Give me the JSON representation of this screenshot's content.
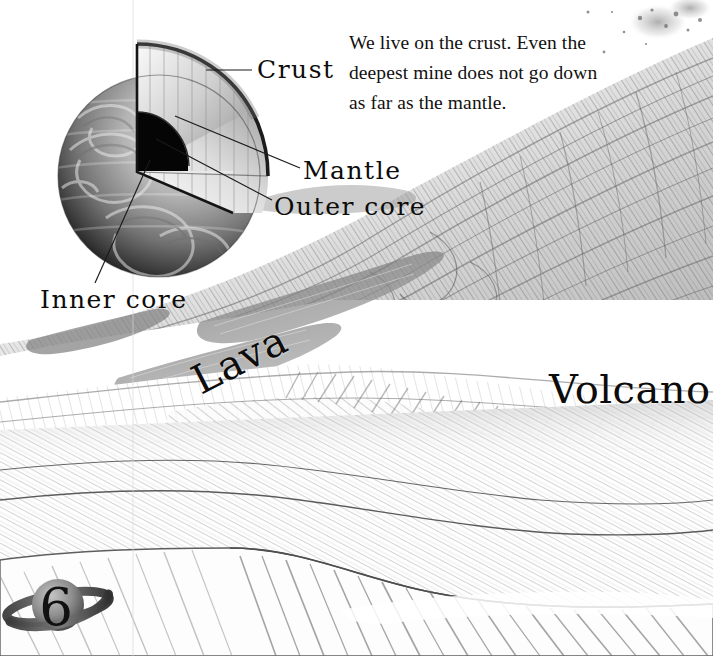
{
  "page": {
    "number": "6",
    "background_color": "#ffffff",
    "ink_color": "#12110f"
  },
  "body_text": {
    "line1": "We live on the crust. Even the",
    "line2": "deepest mine does not go down",
    "line3": "as far as the mantle.",
    "full": "We live on the crust. Even the deepest mine does not go down as far as the mantle."
  },
  "earth_diagram": {
    "title": "Earth cutaway",
    "labels": {
      "crust": "Crust",
      "mantle": "Mantle",
      "outer_core": "Outer core",
      "inner_core": "Inner core"
    }
  },
  "landscape": {
    "labels": {
      "lava": "Lava",
      "volcano": "Volcano"
    }
  }
}
